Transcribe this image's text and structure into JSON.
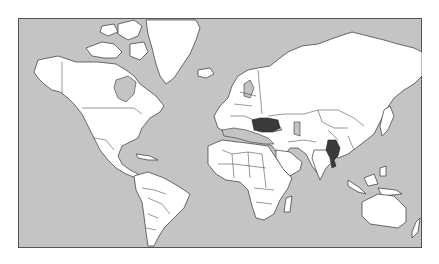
{
  "map": {
    "type": "world-political-mercator",
    "colors": {
      "ocean": "#c4c4c4",
      "land": "#ffffff",
      "border": "#333333",
      "highlight": "#3a3a3a",
      "frame": "#555555"
    },
    "highlighted_countries": [
      {
        "name": "Turkey",
        "color": "#3a3a3a"
      },
      {
        "name": "Thailand",
        "color": "#3a3a3a"
      }
    ]
  }
}
